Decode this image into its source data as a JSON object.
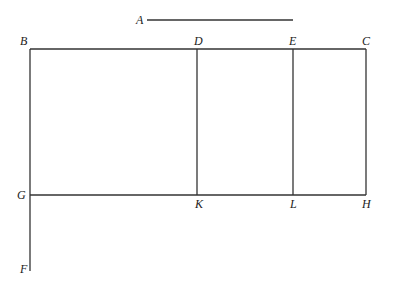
{
  "diagram": {
    "labels": {
      "A": "A",
      "B": "B",
      "C": "C",
      "D": "D",
      "E": "E",
      "F": "F",
      "G": "G",
      "H": "H",
      "K": "K",
      "L": "L"
    },
    "colors": {
      "line": "#333333",
      "text": "#222222",
      "background": "#ffffff"
    }
  }
}
